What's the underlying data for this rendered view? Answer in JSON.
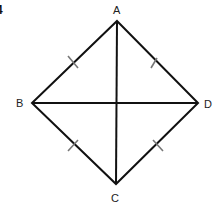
{
  "figure": {
    "number": "4",
    "vertices": {
      "A": {
        "label": "A",
        "x": 117,
        "y": 21
      },
      "B": {
        "label": "B",
        "x": 32,
        "y": 103
      },
      "C": {
        "label": "C",
        "x": 116,
        "y": 184
      },
      "D": {
        "label": "D",
        "x": 198,
        "y": 103
      }
    },
    "sides": [
      "AB",
      "AD",
      "BC",
      "CD"
    ],
    "diagonals": [
      "AC",
      "BD"
    ],
    "tick_marks": "one tick on each side (all sides equal)",
    "stroke_color": "#111111",
    "tick_color": "#777777"
  }
}
